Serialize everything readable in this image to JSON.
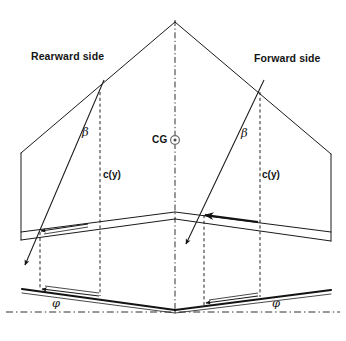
{
  "figure": {
    "background_color": "#ffffff",
    "line_color": "#1a1a1a",
    "dash_color": "#1a1a1a",
    "width": 346,
    "height": 341
  },
  "labels": {
    "rearward_side": "Rearward side",
    "forward_side": "Forward side",
    "center_of_gravity": "CG",
    "chord_left": "c(y)",
    "chord_right": "c(y)",
    "beta_left": "β",
    "beta_right": "β",
    "phi_left": "φ",
    "phi_right": "φ"
  },
  "geometry": {
    "apex": {
      "x": 175,
      "y": 22
    },
    "mid_apex": {
      "x": 175,
      "y": 212
    },
    "base_apex": {
      "x": 175,
      "y": 310
    },
    "left_wing_outer_x": 21,
    "right_wing_outer_x": 331,
    "left_station_x": 100,
    "right_station_x": 260,
    "centerline_x": 175,
    "ground_line_y": 312
  },
  "annotations": {
    "beta_description": "sweep angle between leading edge and chord station",
    "phi_description": "dihedral angle between planform and horizontal datum",
    "chord_description": "local chord length at spanwise station y",
    "cg_description": "center of gravity marker on the centerline"
  },
  "caption": {
    "smudge_text": ""
  }
}
